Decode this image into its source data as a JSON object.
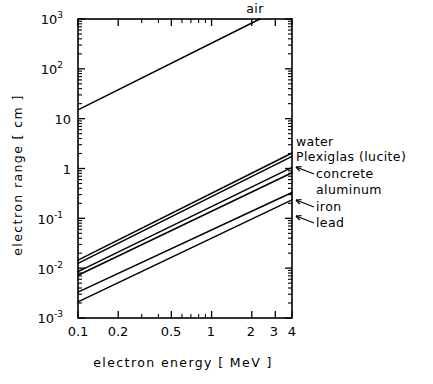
{
  "chart_data": {
    "type": "line",
    "title": "",
    "xlabel": "electron   energy   [ MeV ]",
    "ylabel": "electron  range  [ cm ]",
    "xscale": "log",
    "yscale": "log",
    "xlim": [
      0.1,
      4
    ],
    "ylim": [
      0.001,
      1000
    ],
    "grid": false,
    "legend_position": "right-inline-labels",
    "xticks": [
      {
        "value": 0.1,
        "label": "0.1"
      },
      {
        "value": 0.2,
        "label": "0.2"
      },
      {
        "value": 0.5,
        "label": "0.5"
      },
      {
        "value": 1,
        "label": "1"
      },
      {
        "value": 2,
        "label": "2"
      },
      {
        "value": 3,
        "label": "3"
      },
      {
        "value": 4,
        "label": "4"
      }
    ],
    "yticks": [
      {
        "value": 1000,
        "mantissa": "10",
        "exponent": "3"
      },
      {
        "value": 100,
        "mantissa": "10",
        "exponent": "2"
      },
      {
        "value": 10,
        "mantissa": "10",
        "exponent": ""
      },
      {
        "value": 1,
        "mantissa": "1",
        "exponent": ""
      },
      {
        "value": 0.1,
        "mantissa": "10",
        "exponent": "-1"
      },
      {
        "value": 0.01,
        "mantissa": "10",
        "exponent": "-2"
      },
      {
        "value": 0.001,
        "mantissa": "10",
        "exponent": "-3"
      }
    ],
    "series": [
      {
        "name": "air",
        "label": "air",
        "label_position": "top",
        "x": [
          0.1,
          2.3
        ],
        "y": [
          15,
          1000
        ]
      },
      {
        "name": "water",
        "label": "water",
        "label_position": "right",
        "has_leader": false,
        "x": [
          0.1,
          4
        ],
        "y": [
          0.0145,
          2.05
        ]
      },
      {
        "name": "plexiglas",
        "label": "Plexiglas  (lucite)",
        "label_position": "right",
        "has_leader": false,
        "x": [
          0.1,
          4
        ],
        "y": [
          0.0125,
          1.75
        ]
      },
      {
        "name": "concrete",
        "label": "concrete",
        "label_position": "right",
        "has_leader": true,
        "x": [
          0.1,
          4
        ],
        "y": [
          0.0085,
          1.05
        ]
      },
      {
        "name": "aluminum",
        "label": "aluminum",
        "label_position": "right",
        "has_leader": false,
        "x": [
          0.1,
          4
        ],
        "y": [
          0.0072,
          0.82
        ]
      },
      {
        "name": "iron",
        "label": "iron",
        "label_position": "right",
        "has_leader": true,
        "x": [
          0.1,
          4
        ],
        "y": [
          0.0033,
          0.33
        ]
      },
      {
        "name": "lead",
        "label": "lead",
        "label_position": "right",
        "has_leader": true,
        "x": [
          0.1,
          4
        ],
        "y": [
          0.0021,
          0.235
        ]
      }
    ]
  },
  "axes": {
    "y_title": "electron  range  [ cm ]",
    "x_title": "electron   energy   [ MeV ]"
  },
  "labels": {
    "air": "air",
    "water": "water",
    "plexiglas": "Plexiglas  (lucite)",
    "concrete": "concrete",
    "aluminum": "aluminum",
    "iron": "iron",
    "lead": "lead"
  },
  "xtick_labels": {
    "t0": "0.1",
    "t1": "0.2",
    "t2": "0.5",
    "t3": "1",
    "t4": "2",
    "t5": "3",
    "t6": "4"
  },
  "ytick_labels": {
    "e3_m": "10",
    "e3_e": "3",
    "e2_m": "10",
    "e2_e": "2",
    "e1_m": "10",
    "e0_m": "1",
    "em1_m": "10",
    "em1_e": "-1",
    "em2_m": "10",
    "em2_e": "-2",
    "em3_m": "10",
    "em3_e": "-3"
  },
  "colors": {
    "line": "#000000",
    "background": "#ffffff",
    "axis": "#000000"
  }
}
